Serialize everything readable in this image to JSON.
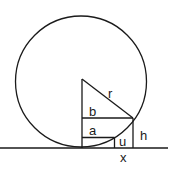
{
  "diagram": {
    "type": "geometry",
    "labels": {
      "r": "r",
      "b": "b",
      "a": "a",
      "h": "h",
      "u": "u",
      "x": "x"
    },
    "colors": {
      "stroke": "#1a1a1a",
      "background": "#ffffff"
    }
  }
}
